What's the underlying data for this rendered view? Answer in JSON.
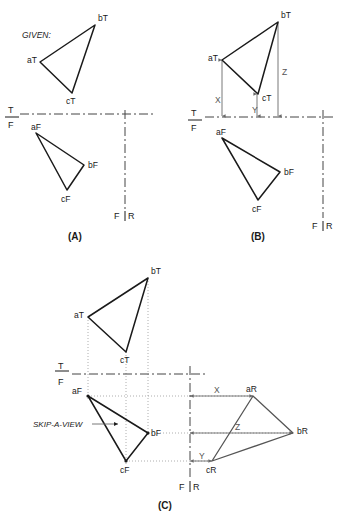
{
  "figure": {
    "title_note": "GIVEN:",
    "skip_view_note": "SKIP-A-VIEW",
    "panels": [
      {
        "id": "panel-a",
        "label": "(A)",
        "fold_top": "T",
        "fold_bottom": "F",
        "fold_left": "F",
        "fold_right": "R",
        "top_view": {
          "points": [
            {
              "name": "aT",
              "x": 40,
              "y": 62,
              "label_dx": -13,
              "label_dy": 1
            },
            {
              "name": "bT",
              "x": 95,
              "y": 25,
              "label_dx": 3,
              "label_dy": -4
            },
            {
              "name": "cT",
              "x": 72,
              "y": 93,
              "label_dx": -2,
              "label_dy": 11
            }
          ]
        },
        "front_view": {
          "points": [
            {
              "name": "aF",
              "x": 36,
              "y": 133,
              "label_dx": -4,
              "label_dy": -5
            },
            {
              "name": "bF",
              "x": 84,
              "y": 165,
              "label_dx": 4,
              "label_dy": 3
            },
            {
              "name": "cF",
              "x": 67,
              "y": 190,
              "label_dx": -4,
              "label_dy": 12
            }
          ]
        }
      },
      {
        "id": "panel-b",
        "label": "(B)",
        "fold_top": "T",
        "fold_bottom": "F",
        "fold_left": "F",
        "fold_right": "R",
        "top_view": {
          "points": [
            {
              "name": "aT",
              "x": 222,
              "y": 60,
              "label_dx": -14,
              "label_dy": 1
            },
            {
              "name": "bT",
              "x": 278,
              "y": 22,
              "label_dx": 3,
              "label_dy": -4
            },
            {
              "name": "cT",
              "x": 258,
              "y": 94,
              "label_dx": 4,
              "label_dy": 7
            }
          ]
        },
        "front_view": {
          "points": [
            {
              "name": "aF",
              "x": 222,
              "y": 138,
              "label_dx": -4,
              "label_dy": -5
            },
            {
              "name": "bF",
              "x": 280,
              "y": 172,
              "label_dx": 4,
              "label_dy": 3
            },
            {
              "name": "cF",
              "x": 258,
              "y": 200,
              "label_dx": -4,
              "label_dy": 12
            }
          ]
        },
        "dimensions": [
          {
            "name": "X",
            "x": 222,
            "label_y": 100
          },
          {
            "name": "Y",
            "x": 257,
            "label_y": 110
          },
          {
            "name": "Z",
            "x": 278,
            "label_y": 72
          }
        ]
      },
      {
        "id": "panel-c",
        "label": "(C)",
        "fold_top": "T",
        "fold_bottom": "F",
        "fold_left": "F",
        "fold_right": "R",
        "top_view": {
          "points": [
            {
              "name": "aT",
              "x": 88,
              "y": 317,
              "label_dx": -14,
              "label_dy": 1
            },
            {
              "name": "bT",
              "x": 148,
              "y": 278,
              "label_dx": 3,
              "label_dy": -4
            },
            {
              "name": "cT",
              "x": 126,
              "y": 352,
              "label_dx": -2,
              "label_dy": 11
            }
          ]
        },
        "front_view": {
          "points": [
            {
              "name": "aF",
              "x": 88,
              "y": 396,
              "label_dx": -16,
              "label_dy": 1
            },
            {
              "name": "bF",
              "x": 148,
              "y": 433,
              "label_dx": 4,
              "label_dy": 3
            },
            {
              "name": "cF",
              "x": 126,
              "y": 461,
              "label_dx": -4,
              "label_dy": 12
            }
          ]
        },
        "right_view": {
          "points": [
            {
              "name": "aR",
              "x": 253,
              "y": 396,
              "label_dx": -2,
              "label_dy": -4
            },
            {
              "name": "bR",
              "x": 293,
              "y": 433,
              "label_dx": 4,
              "label_dy": 2
            },
            {
              "name": "cR",
              "x": 212,
              "y": 461,
              "label_dx": -4,
              "label_dy": 12
            }
          ]
        },
        "dimensions": [
          {
            "name": "X",
            "y": 396,
            "from_x": 190,
            "to_x": 253,
            "label_x": 218
          },
          {
            "name": "Z",
            "y": 433,
            "from_x": 190,
            "to_x": 293,
            "label_x": 238
          },
          {
            "name": "Y",
            "y": 461,
            "from_x": 190,
            "to_x": 212,
            "label_x": 203
          }
        ]
      }
    ]
  },
  "geometry": {
    "panel_a": {
      "fold_y": 114,
      "fold_x1": 20,
      "fold_x2": 155,
      "fr_x": 125,
      "fr_y1": 114,
      "fr_y2": 210,
      "fr_label_y": 218,
      "tf_label_x": 10,
      "tf_t_y": 110,
      "tf_f_y": 124,
      "tf_tick_x1": 5,
      "tf_tick_x2": 19,
      "label_x": 76,
      "label_y": 239
    },
    "panel_b": {
      "fold_y": 117,
      "fold_x1": 190,
      "fold_x2": 333,
      "fr_x": 323,
      "fr_y1": 108,
      "fr_y2": 215,
      "fr_label_y": 228,
      "tf_label_x": 193,
      "tf_t_y": 113,
      "tf_f_y": 127,
      "tf_tick_x1": 188,
      "tf_tick_x2": 202,
      "label_x": 258,
      "label_y": 239
    },
    "panel_c": {
      "fold_y": 374,
      "fold_x1": 55,
      "fold_x2": 205,
      "fr_x": 190,
      "fr_y1": 366,
      "fr_y2": 478,
      "fr_label_y": 489,
      "tf_label_x": 60,
      "tf_t_y": 370,
      "tf_f_y": 384,
      "tf_tick_x1": 55,
      "tf_tick_x2": 69,
      "label_x": 165,
      "label_y": 508
    },
    "given_x": 22,
    "given_y": 35,
    "skip_x": 33,
    "skip_y": 427,
    "skip_arrow_x1": 92,
    "skip_arrow_x2": 118,
    "skip_arrow_y": 424
  },
  "colors": {
    "stroke_main": "#1a1a1a",
    "stroke_dim": "#6a6a6a",
    "stroke_projection": "#9a9a9a",
    "background": "#ffffff"
  }
}
